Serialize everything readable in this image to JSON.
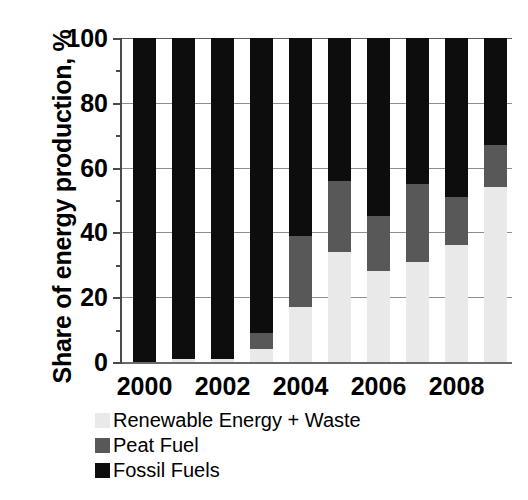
{
  "chart_data": {
    "type": "bar",
    "subtype": "stacked-bar-100-percent",
    "title": "",
    "xlabel": "",
    "ylabel": "Share of energy production, %",
    "ylim": [
      0,
      100
    ],
    "yticks": [
      0,
      20,
      40,
      60,
      80,
      100
    ],
    "yminor_step": 10,
    "grid": true,
    "grid_axis": "y",
    "legend_position": "below-left",
    "stack_order_bottom_to_top": [
      "Renewable Energy + Waste",
      "Peat Fuel",
      "Fossil Fuels"
    ],
    "categories": [
      "2000",
      "2001",
      "2002",
      "2003",
      "2004",
      "2005",
      "2006",
      "2007",
      "2008",
      "2009"
    ],
    "xtick_labels": [
      "2000",
      "2002",
      "2004",
      "2006",
      "2008"
    ],
    "series": [
      {
        "name": "Renewable Energy + Waste",
        "color": "#e9e9e9",
        "values": [
          0,
          1,
          1,
          4,
          17,
          34,
          28,
          31,
          36,
          54
        ]
      },
      {
        "name": "Peat Fuel",
        "color": "#585858",
        "values": [
          0,
          0,
          0,
          5,
          22,
          22,
          17,
          24,
          15,
          13
        ]
      },
      {
        "name": "Fossil Fuels",
        "color": "#0d0d0d",
        "values": [
          100,
          99,
          99,
          91,
          61,
          44,
          55,
          45,
          49,
          33
        ]
      }
    ]
  },
  "axis": {
    "y_title": "Share of energy production, %",
    "y_tick_labels": [
      "100",
      "80",
      "60",
      "40",
      "20",
      "0"
    ],
    "x_tick_labels": [
      "2000",
      "2002",
      "2004",
      "2006",
      "2008"
    ]
  },
  "legend": {
    "items": [
      {
        "label": "Renewable Energy + Waste",
        "color": "#e9e9e9"
      },
      {
        "label": "Peat Fuel",
        "color": "#585858"
      },
      {
        "label": "Fossil Fuels",
        "color": "#0d0d0d"
      }
    ]
  }
}
